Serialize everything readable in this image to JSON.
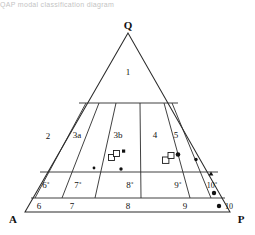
{
  "figure": {
    "type": "ternary-classification-diagram",
    "caption_top": "QAP modal classification diagram",
    "corners": {
      "apex": "Q",
      "bottom_left": "A",
      "bottom_right": "P"
    },
    "field_labels": [
      {
        "id": "f1",
        "text": "1",
        "x": 128,
        "y": 73,
        "size": "normal"
      },
      {
        "id": "f2",
        "text": "2",
        "x": 48,
        "y": 137,
        "size": "normal"
      },
      {
        "id": "f3a",
        "text": "3a",
        "x": 77,
        "y": 136,
        "size": "normal"
      },
      {
        "id": "f3b",
        "text": "3b",
        "x": 118,
        "y": 136,
        "size": "normal"
      },
      {
        "id": "f4",
        "text": "4",
        "x": 155,
        "y": 136,
        "size": "normal"
      },
      {
        "id": "f5",
        "text": "5",
        "x": 176,
        "y": 136,
        "size": "normal"
      },
      {
        "id": "f6p",
        "text": "6˚",
        "x": 46,
        "y": 186,
        "size": "normal"
      },
      {
        "id": "f7p",
        "text": "7˚",
        "x": 78,
        "y": 186,
        "size": "normal"
      },
      {
        "id": "f8p",
        "text": "8˚",
        "x": 130,
        "y": 186,
        "size": "normal"
      },
      {
        "id": "f9p",
        "text": "9˚",
        "x": 178,
        "y": 186,
        "size": "normal"
      },
      {
        "id": "f10p",
        "text": "10˚",
        "x": 212,
        "y": 186,
        "size": "normal"
      },
      {
        "id": "f6",
        "text": "6",
        "x": 39,
        "y": 207,
        "size": "normal"
      },
      {
        "id": "f7",
        "text": "7",
        "x": 72,
        "y": 207,
        "size": "normal"
      },
      {
        "id": "f8",
        "text": "8",
        "x": 128,
        "y": 207,
        "size": "normal"
      },
      {
        "id": "f9",
        "text": "9",
        "x": 185,
        "y": 207,
        "size": "normal"
      },
      {
        "id": "f10",
        "text": "10",
        "x": 229,
        "y": 207,
        "size": "normal"
      }
    ],
    "outer_triangle": {
      "apex": [
        128,
        33
      ],
      "left": [
        25,
        212
      ],
      "right": [
        230,
        212
      ]
    },
    "horizontal_lines": [
      {
        "id": "h-q65",
        "y": 103,
        "x1": 79,
        "x2": 178
      },
      {
        "id": "h-q20",
        "y": 172,
        "x1": 40,
        "x2": 218
      },
      {
        "id": "h-q05",
        "y": 198,
        "x1": 31,
        "x2": 225
      }
    ],
    "radial_lines": [
      {
        "id": "r-a10",
        "label": "A10",
        "top": [
          86,
          103
        ],
        "bottom": [
          35,
          198
        ]
      },
      {
        "id": "r-a35",
        "label": "A35",
        "top": [
          99,
          103
        ],
        "bottom": [
          62,
          198
        ]
      },
      {
        "id": "r-a65",
        "label": "A65",
        "top": [
          116,
          103
        ],
        "bottom": [
          95,
          198
        ]
      },
      {
        "id": "r-a90",
        "label": "A90",
        "top": [
          140,
          103
        ],
        "bottom": [
          141,
          198
        ]
      },
      {
        "id": "r-p10",
        "label": "P10",
        "top": [
          164,
          103
        ],
        "bottom": [
          190,
          198
        ]
      },
      {
        "id": "r-p35",
        "label": "P35",
        "top": [
          172,
          103
        ],
        "bottom": [
          211,
          198
        ]
      }
    ],
    "data_points": [
      {
        "id": "p1",
        "marker": "open-square",
        "x": 112,
        "y": 158
      },
      {
        "id": "p2",
        "marker": "open-square",
        "x": 117,
        "y": 154
      },
      {
        "id": "p3",
        "marker": "filled-square",
        "x": 124,
        "y": 152
      },
      {
        "id": "p4",
        "marker": "filled-dot",
        "x": 121,
        "y": 169
      },
      {
        "id": "p5",
        "marker": "open-square",
        "x": 166,
        "y": 160
      },
      {
        "id": "p6",
        "marker": "open-square",
        "x": 172,
        "y": 156
      },
      {
        "id": "p7",
        "marker": "filled-dot",
        "x": 179,
        "y": 154
      },
      {
        "id": "p8",
        "marker": "filled-dot",
        "x": 196,
        "y": 160
      },
      {
        "id": "p9",
        "marker": "filled-dot",
        "x": 94,
        "y": 168
      },
      {
        "id": "p10",
        "marker": "filled-tri",
        "x": 211,
        "y": 174
      },
      {
        "id": "p11",
        "marker": "filled-dot",
        "x": 214,
        "y": 193
      },
      {
        "id": "p12",
        "marker": "filled-dot",
        "x": 219,
        "y": 206
      }
    ],
    "legend_note": ""
  }
}
